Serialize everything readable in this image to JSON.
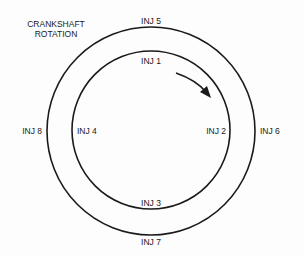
{
  "title": {
    "line1": "CRANKSHAFT",
    "line2": "ROTATION"
  },
  "colors": {
    "stroke": "#1a1a1a",
    "background": "#fdfdfd"
  },
  "outer_ring": {
    "labels": {
      "top": "INJ 5",
      "right": "INJ 6",
      "bottom": "INJ 7",
      "left": "INJ 8"
    }
  },
  "inner_ring": {
    "labels": {
      "top": "INJ 1",
      "right": "INJ 2",
      "bottom": "INJ 3",
      "left": "INJ 4"
    }
  },
  "arrow": {
    "direction": "clockwise",
    "icon": "rotation-arrow-icon"
  }
}
